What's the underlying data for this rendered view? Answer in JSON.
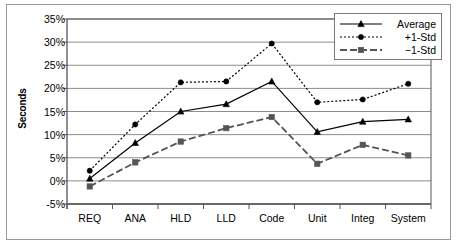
{
  "chart_data": {
    "type": "line",
    "title": "",
    "xlabel": "",
    "ylabel": "Seconds",
    "categories": [
      "REQ",
      "ANA",
      "HLD",
      "LLD",
      "Code",
      "Unit",
      "Integ",
      "System"
    ],
    "ylim": [
      -5,
      35
    ],
    "ytick_labels": [
      "35%",
      "30%",
      "25%",
      "20%",
      "15%",
      "10%",
      "5%",
      "0%",
      "-5%"
    ],
    "ytick_values": [
      35,
      30,
      25,
      20,
      15,
      10,
      5,
      0,
      -5
    ],
    "grid": true,
    "legend_position": "top-right",
    "series": [
      {
        "name": "Average",
        "line_style": "solid",
        "marker": "triangle",
        "color": "#000000",
        "values": [
          0.5,
          8.2,
          15.0,
          16.6,
          21.5,
          10.6,
          12.8,
          13.3
        ]
      },
      {
        "name": "+1-Std",
        "line_style": "dotted",
        "marker": "circle",
        "color": "#000000",
        "values": [
          2.2,
          12.2,
          21.3,
          21.5,
          29.7,
          17.0,
          17.6,
          21.0
        ]
      },
      {
        "name": "−1-Std",
        "line_style": "dashed",
        "marker": "square",
        "color": "#555555",
        "values": [
          -1.2,
          4.0,
          8.5,
          11.4,
          13.8,
          3.7,
          7.8,
          5.5
        ]
      }
    ]
  },
  "legend": {
    "items": [
      {
        "label": "Average"
      },
      {
        "label": "+1-Std"
      },
      {
        "label": "−1-Std"
      }
    ]
  }
}
